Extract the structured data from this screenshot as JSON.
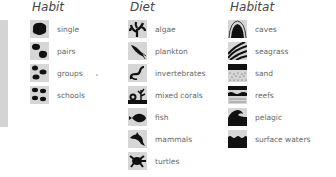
{
  "legend": {
    "habit": {
      "title": "Habit",
      "items": [
        {
          "label": "single",
          "icon": "single-fish-blob-icon"
        },
        {
          "label": "pairs",
          "icon": "pair-fish-blob-icon"
        },
        {
          "label": "groups",
          "icon": "group-fish-blob-icon"
        },
        {
          "label": "schools",
          "icon": "school-fish-blob-icon"
        }
      ]
    },
    "diet": {
      "title": "Diet",
      "items": [
        {
          "label": "algae",
          "icon": "algae-icon"
        },
        {
          "label": "plankton",
          "icon": "plankton-icon"
        },
        {
          "label": "invertebrates",
          "icon": "worm-icon"
        },
        {
          "label": "mixed corals",
          "icon": "coral-icon"
        },
        {
          "label": "fish",
          "icon": "fish-icon"
        },
        {
          "label": "mammals",
          "icon": "dolphin-icon"
        },
        {
          "label": "turtles",
          "icon": "turtle-icon"
        }
      ]
    },
    "habitat": {
      "title": "Habitat",
      "items": [
        {
          "label": "caves",
          "icon": "cave-icon"
        },
        {
          "label": "seagrass",
          "icon": "seagrass-icon"
        },
        {
          "label": "sand",
          "icon": "sand-icon"
        },
        {
          "label": "reefs",
          "icon": "reef-icon"
        },
        {
          "label": "pelagic",
          "icon": "wave-icon"
        },
        {
          "label": "surface waters",
          "icon": "surface-water-icon"
        }
      ]
    }
  }
}
